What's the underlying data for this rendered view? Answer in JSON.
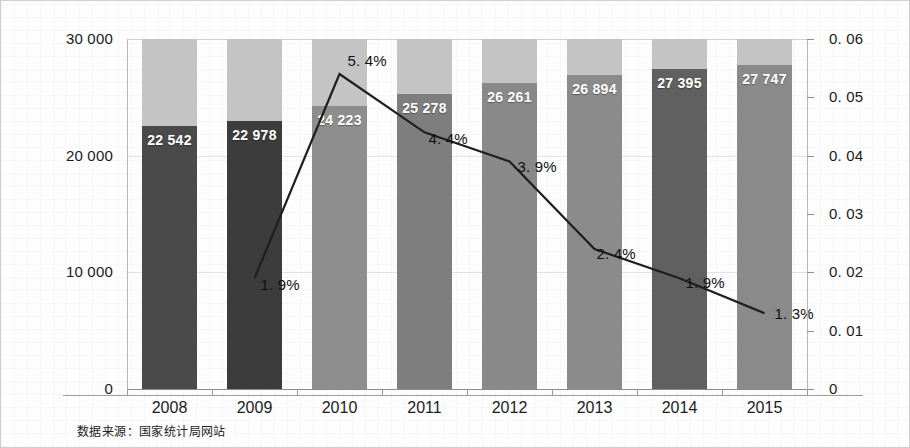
{
  "chart_data": {
    "type": "bar",
    "title": "",
    "subtitle": "",
    "xlabel": "",
    "ylabel": "",
    "categories": [
      "2008",
      "2009",
      "2010",
      "2011",
      "2012",
      "2013",
      "2014",
      "2015"
    ],
    "grid": true,
    "legend_position": "none",
    "series": [
      {
        "name": "总量",
        "type": "bar",
        "axis": "left",
        "values": [
          22542,
          22978,
          24223,
          25278,
          26261,
          26894,
          27395,
          27747
        ],
        "value_labels": [
          "22 542",
          "22 978",
          "24 223",
          "25 278",
          "26 261",
          "26 894",
          "27 395",
          "27 747"
        ],
        "bar_colors": [
          "#4a4a4a",
          "#3c3c3c",
          "#8e8e8e",
          "#7e7e7e",
          "#898989",
          "#8b8b8b",
          "#606060",
          "#8a8a8a"
        ],
        "cap_color": "#c4c4c4",
        "cap_to": 30000
      },
      {
        "name": "增长率",
        "type": "line",
        "axis": "right",
        "x": [
          "2009",
          "2010",
          "2011",
          "2012",
          "2013",
          "2014",
          "2015"
        ],
        "values": [
          0.019,
          0.054,
          0.044,
          0.039,
          0.024,
          0.019,
          0.013
        ],
        "point_labels": [
          "1. 9%",
          "5. 4%",
          "4. 4%",
          "3. 9%",
          "2. 4%",
          "1. 9%",
          "1. 3%"
        ],
        "line_color": "#1f1f1f",
        "line_width": 2
      }
    ],
    "left_axis": {
      "min": 0,
      "max": 30000,
      "ticks": [
        0,
        10000,
        20000,
        30000
      ],
      "tick_labels": [
        "0",
        "10 000",
        "20 000",
        "30 000"
      ]
    },
    "right_axis": {
      "min": 0,
      "max": 0.06,
      "ticks": [
        0,
        0.01,
        0.02,
        0.03,
        0.04,
        0.05,
        0.06
      ],
      "tick_labels": [
        "0",
        "0. 01",
        "0. 02",
        "0. 03",
        "0. 04",
        "0. 05",
        "0. 06"
      ]
    }
  },
  "footnote": {
    "text": "数据来源：国家统计局网站"
  },
  "colors": {
    "background": "#fdfdfd",
    "border": "#cfcfcf",
    "grid": "#e2e2e2",
    "axis": "#9a9a9a",
    "text": "#1b1b1b",
    "line": "#1f1f1f",
    "bar_cap": "#c4c4c4"
  }
}
